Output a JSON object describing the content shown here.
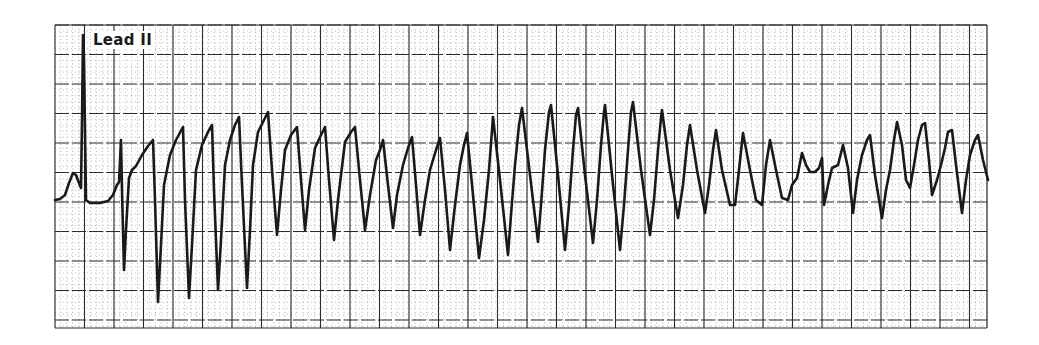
{
  "chart_data": {
    "type": "line",
    "title": "",
    "lead_label": "Lead II",
    "xlabel": "",
    "ylabel": "",
    "grid": true,
    "legend": "none",
    "paper": {
      "x0": 55,
      "x1": 987,
      "y0": 25,
      "y1": 328,
      "major_spacing_px": 29.5,
      "minor_spacing_px": 5.9,
      "major_color": "#2b2b2b",
      "minor_color": "#9a9a9a",
      "trace_color": "#1a1a1a"
    },
    "baseline_y": 200,
    "trace_points": [
      [
        55,
        200
      ],
      [
        60,
        199
      ],
      [
        65,
        195
      ],
      [
        69,
        183
      ],
      [
        73,
        173
      ],
      [
        76,
        175
      ],
      [
        79,
        183
      ],
      [
        81,
        188
      ],
      [
        82,
        120
      ],
      [
        83,
        35
      ],
      [
        84,
        60
      ],
      [
        86,
        200
      ],
      [
        90,
        203
      ],
      [
        100,
        203
      ],
      [
        108,
        201
      ],
      [
        113,
        195
      ],
      [
        117,
        185
      ],
      [
        119,
        182
      ],
      [
        121,
        140
      ],
      [
        122,
        190
      ],
      [
        124,
        270
      ],
      [
        126,
        230
      ],
      [
        129,
        178
      ],
      [
        132,
        170
      ],
      [
        136,
        166
      ],
      [
        142,
        155
      ],
      [
        148,
        146
      ],
      [
        153,
        140
      ],
      [
        155,
        200
      ],
      [
        158,
        302
      ],
      [
        161,
        245
      ],
      [
        164,
        185
      ],
      [
        170,
        155
      ],
      [
        176,
        140
      ],
      [
        183,
        127
      ],
      [
        185,
        200
      ],
      [
        189,
        298
      ],
      [
        192,
        245
      ],
      [
        196,
        170
      ],
      [
        202,
        145
      ],
      [
        208,
        132
      ],
      [
        212,
        125
      ],
      [
        214,
        190
      ],
      [
        218,
        290
      ],
      [
        221,
        240
      ],
      [
        225,
        165
      ],
      [
        230,
        140
      ],
      [
        235,
        125
      ],
      [
        239,
        117
      ],
      [
        242,
        185
      ],
      [
        247,
        288
      ],
      [
        250,
        230
      ],
      [
        253,
        165
      ],
      [
        258,
        132
      ],
      [
        264,
        120
      ],
      [
        268,
        112
      ],
      [
        272,
        170
      ],
      [
        277,
        235
      ],
      [
        281,
        190
      ],
      [
        285,
        150
      ],
      [
        291,
        135
      ],
      [
        297,
        127
      ],
      [
        301,
        180
      ],
      [
        305,
        230
      ],
      [
        309,
        190
      ],
      [
        315,
        148
      ],
      [
        321,
        135
      ],
      [
        325,
        127
      ],
      [
        329,
        180
      ],
      [
        334,
        240
      ],
      [
        338,
        200
      ],
      [
        345,
        142
      ],
      [
        351,
        132
      ],
      [
        355,
        127
      ],
      [
        360,
        180
      ],
      [
        365,
        230
      ],
      [
        370,
        195
      ],
      [
        376,
        160
      ],
      [
        380,
        150
      ],
      [
        383,
        140
      ],
      [
        388,
        185
      ],
      [
        393,
        228
      ],
      [
        397,
        195
      ],
      [
        403,
        165
      ],
      [
        408,
        148
      ],
      [
        412,
        137
      ],
      [
        416,
        185
      ],
      [
        420,
        235
      ],
      [
        425,
        200
      ],
      [
        430,
        170
      ],
      [
        436,
        150
      ],
      [
        440,
        138
      ],
      [
        445,
        190
      ],
      [
        450,
        250
      ],
      [
        455,
        205
      ],
      [
        460,
        165
      ],
      [
        464,
        145
      ],
      [
        467,
        133
      ],
      [
        473,
        195
      ],
      [
        479,
        258
      ],
      [
        484,
        220
      ],
      [
        489,
        170
      ],
      [
        493,
        117
      ],
      [
        500,
        180
      ],
      [
        508,
        255
      ],
      [
        511,
        215
      ],
      [
        515,
        165
      ],
      [
        519,
        125
      ],
      [
        522,
        108
      ],
      [
        530,
        175
      ],
      [
        538,
        242
      ],
      [
        541,
        205
      ],
      [
        545,
        150
      ],
      [
        549,
        112
      ],
      [
        551,
        105
      ],
      [
        558,
        175
      ],
      [
        565,
        250
      ],
      [
        569,
        205
      ],
      [
        573,
        150
      ],
      [
        576,
        115
      ],
      [
        578,
        108
      ],
      [
        585,
        175
      ],
      [
        593,
        243
      ],
      [
        597,
        200
      ],
      [
        601,
        145
      ],
      [
        604,
        112
      ],
      [
        605,
        105
      ],
      [
        612,
        175
      ],
      [
        620,
        250
      ],
      [
        624,
        205
      ],
      [
        628,
        150
      ],
      [
        631,
        112
      ],
      [
        633,
        102
      ],
      [
        641,
        170
      ],
      [
        650,
        235
      ],
      [
        654,
        200
      ],
      [
        658,
        150
      ],
      [
        661,
        118
      ],
      [
        662,
        110
      ],
      [
        670,
        170
      ],
      [
        678,
        218
      ],
      [
        683,
        185
      ],
      [
        687,
        145
      ],
      [
        690,
        125
      ],
      [
        697,
        170
      ],
      [
        705,
        213
      ],
      [
        709,
        185
      ],
      [
        713,
        150
      ],
      [
        716,
        130
      ],
      [
        722,
        170
      ],
      [
        730,
        205
      ],
      [
        735,
        205
      ],
      [
        739,
        170
      ],
      [
        743,
        133
      ],
      [
        750,
        170
      ],
      [
        756,
        200
      ],
      [
        762,
        205
      ],
      [
        766,
        165
      ],
      [
        770,
        140
      ],
      [
        776,
        170
      ],
      [
        782,
        198
      ],
      [
        788,
        200
      ],
      [
        792,
        185
      ],
      [
        797,
        178
      ],
      [
        802,
        153
      ],
      [
        806,
        165
      ],
      [
        810,
        172
      ],
      [
        815,
        172
      ],
      [
        819,
        168
      ],
      [
        822,
        158
      ],
      [
        824,
        205
      ],
      [
        828,
        185
      ],
      [
        832,
        168
      ],
      [
        838,
        165
      ],
      [
        843,
        145
      ],
      [
        848,
        168
      ],
      [
        853,
        213
      ],
      [
        857,
        180
      ],
      [
        862,
        155
      ],
      [
        867,
        140
      ],
      [
        870,
        135
      ],
      [
        875,
        175
      ],
      [
        882,
        218
      ],
      [
        886,
        190
      ],
      [
        890,
        170
      ],
      [
        894,
        140
      ],
      [
        897,
        122
      ],
      [
        902,
        145
      ],
      [
        906,
        180
      ],
      [
        910,
        188
      ],
      [
        914,
        165
      ],
      [
        918,
        140
      ],
      [
        922,
        125
      ],
      [
        925,
        123
      ],
      [
        929,
        160
      ],
      [
        932,
        195
      ],
      [
        937,
        180
      ],
      [
        941,
        165
      ],
      [
        945,
        148
      ],
      [
        948,
        132
      ],
      [
        952,
        130
      ],
      [
        956,
        165
      ],
      [
        962,
        213
      ],
      [
        966,
        180
      ],
      [
        970,
        155
      ],
      [
        975,
        140
      ],
      [
        978,
        135
      ],
      [
        983,
        160
      ],
      [
        988,
        180
      ]
    ],
    "segments": [
      {
        "name": "sinus-beat",
        "x_range": [
          55,
          110
        ]
      },
      {
        "name": "polymorphic-vt",
        "x_range": [
          110,
          988
        ]
      }
    ]
  }
}
